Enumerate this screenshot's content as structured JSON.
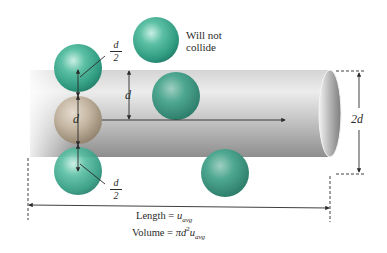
{
  "figure": {
    "annotation_not_collide": "Will not\ncollide",
    "annotation_line1": "Will not",
    "annotation_line2": "collide",
    "labels": {
      "half_d_top_num": "d",
      "half_d_top_den": "2",
      "half_d_bottom_num": "d",
      "half_d_bottom_den": "2",
      "d_center": "d",
      "d_side": "d",
      "diameter": "2d"
    },
    "caption": {
      "length_prefix": "Length = ",
      "length_var": "u",
      "length_sub": "avg",
      "volume_prefix": "Volume = ",
      "volume_expr": "πd",
      "volume_sup": "2",
      "volume_var": "u",
      "volume_sub": "avg"
    },
    "colors": {
      "teal_sphere": "#3aa58c",
      "tan_sphere": "#b5a58f",
      "cylinder_light": "#e6e6e6",
      "cylinder_dark": "#8a8a8a",
      "line": "#2a2a2a"
    }
  }
}
